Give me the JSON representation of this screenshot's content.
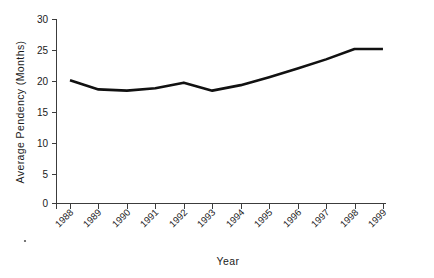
{
  "chart_data": {
    "type": "line",
    "title": "",
    "xlabel": "Year",
    "ylabel": "Average  Pendency  (Months)",
    "categories": [
      "1988",
      "1989",
      "1990",
      "1991",
      "1992",
      "1993",
      "1994",
      "1995",
      "1996",
      "1997",
      "1998",
      "1999"
    ],
    "values": [
      20.1,
      18.6,
      18.4,
      18.8,
      19.7,
      18.4,
      19.3,
      20.6,
      22.0,
      23.5,
      25.2,
      25.2
    ],
    "series": [
      {
        "name": "Average Pendency",
        "values": [
          20.1,
          18.6,
          18.4,
          18.8,
          19.7,
          18.4,
          19.3,
          20.6,
          22.0,
          23.5,
          25.2,
          25.2
        ]
      }
    ],
    "ylim": [
      0,
      30
    ],
    "ytick_values": [
      0,
      5,
      10,
      15,
      20,
      25,
      30
    ],
    "ytick_labels": [
      "0",
      "5",
      "10",
      "15",
      "20",
      "25",
      "30"
    ],
    "grid": false,
    "legend": "none",
    "line_color": "#111111",
    "axis_color": "#3c3c3c",
    "background_color": "#ffffff",
    "xtick_label_rotation": -45
  },
  "axes": {
    "y_title": "Average  Pendency  (Months)",
    "x_title": "Year"
  }
}
